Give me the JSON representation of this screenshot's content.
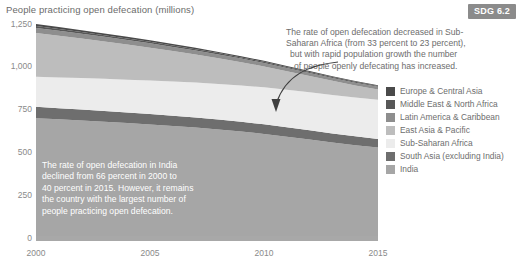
{
  "figure": {
    "title": "People practicing open defecation (millions)",
    "badge": "SDG 6.2"
  },
  "annotations": {
    "outer": {
      "line1": "The rate of open defecation decreased in Sub-",
      "line2": "Saharan Africa (from 33 percent to 23 percent),",
      "line3": "but with rapid population growth the number",
      "line4": "of people openly defecating has increased."
    },
    "inner": {
      "line1": "The rate of open defecation in India",
      "line2": "declined from 66 percent in 2000 to",
      "line3": "40 percent in 2015. However, it remains",
      "line4": "the country with the largest number of",
      "line5": "people practicing open defecation."
    }
  },
  "legend": {
    "items": [
      {
        "label": "Europe & Central Asia",
        "color": "#4a4a4a"
      },
      {
        "label": "Middle East & North Africa",
        "color": "#575757"
      },
      {
        "label": "Latin America & Caribbean",
        "color": "#8e8e8e"
      },
      {
        "label": "East Asia & Pacific",
        "color": "#bdbdbd"
      },
      {
        "label": "Sub-Saharan Africa",
        "color": "#ececec"
      },
      {
        "label": "South Asia (excluding India)",
        "color": "#6e6e6e"
      },
      {
        "label": "India",
        "color": "#a6a6a6"
      }
    ]
  },
  "chart_data": {
    "type": "area",
    "title": "People practicing open defecation (millions)",
    "xlabel": "",
    "ylabel": "",
    "stacked": true,
    "grid": false,
    "legend_position": "right",
    "x": [
      2000,
      2001,
      2002,
      2003,
      2004,
      2005,
      2006,
      2007,
      2008,
      2009,
      2010,
      2011,
      2012,
      2013,
      2014,
      2015
    ],
    "xticks": [
      "2000",
      "2005",
      "2010",
      "2015"
    ],
    "xlim": [
      2000,
      2015
    ],
    "ylim": [
      0,
      1250
    ],
    "yticks": [
      "0",
      "250",
      "500",
      "750",
      "1,000",
      "1,250"
    ],
    "ytick_values": [
      0,
      250,
      500,
      750,
      1000,
      1250
    ],
    "series": [
      {
        "name": "India",
        "values": [
          700,
          693,
          686,
          679,
          671,
          663,
          654,
          645,
          634,
          622,
          608,
          592,
          575,
          558,
          542,
          528
        ]
      },
      {
        "name": "South Asia (excluding India)",
        "values": [
          66,
          65,
          64,
          63,
          62,
          61,
          60,
          59,
          58,
          57,
          56,
          55,
          54,
          53,
          52,
          51
        ]
      },
      {
        "name": "Sub-Saharan Africa",
        "values": [
          176,
          180,
          184,
          188,
          192,
          196,
          200,
          204,
          208,
          212,
          216,
          219,
          222,
          225,
          227,
          229
        ]
      },
      {
        "name": "East Asia & Pacific",
        "values": [
          255,
          243,
          231,
          218,
          205,
          192,
          178,
          164,
          150,
          136,
          122,
          108,
          95,
          82,
          70,
          60
        ]
      },
      {
        "name": "Latin America & Caribbean",
        "values": [
          30,
          29,
          28,
          27,
          26,
          25,
          24,
          23,
          22,
          21,
          20,
          19,
          18,
          17,
          16,
          15
        ]
      },
      {
        "name": "Middle East & North Africa",
        "values": [
          12,
          11,
          11,
          10,
          10,
          9,
          9,
          8,
          8,
          7,
          7,
          6,
          6,
          5,
          5,
          5
        ]
      },
      {
        "name": "Europe & Central Asia",
        "values": [
          11,
          11,
          10,
          10,
          9,
          9,
          8,
          8,
          7,
          7,
          6,
          6,
          5,
          5,
          5,
          4
        ]
      }
    ],
    "totals": [
      1250,
      1232,
      1214,
      1195,
      1175,
      1155,
      1133,
      1111,
      1087,
      1062,
      1035,
      1005,
      975,
      945,
      917,
      892
    ]
  }
}
